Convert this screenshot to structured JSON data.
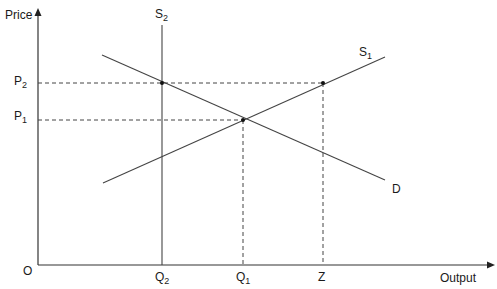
{
  "diagram": {
    "type": "supply-demand",
    "axes": {
      "y_label": "Price",
      "x_label": "Output",
      "origin_label": "O"
    },
    "price_levels": [
      {
        "label": "P",
        "sub": "2",
        "y": 83
      },
      {
        "label": "P",
        "sub": "1",
        "y": 120
      }
    ],
    "quantity_levels": [
      {
        "label": "Q",
        "sub": "2",
        "x": 162
      },
      {
        "label": "Q",
        "sub": "1",
        "x": 243
      },
      {
        "label": "Z",
        "sub": "",
        "x": 323
      }
    ],
    "curves": [
      {
        "name": "S",
        "sub": "2",
        "kind": "vertical supply"
      },
      {
        "name": "S",
        "sub": "1",
        "kind": "upward sloping supply"
      },
      {
        "name": "D",
        "sub": "",
        "kind": "downward sloping demand"
      }
    ],
    "points": [
      {
        "at": "S2 ∩ D",
        "x": 162,
        "y": 83
      },
      {
        "at": "S1 ∩ D",
        "x": 243,
        "y": 120
      },
      {
        "at": "S1 at P2",
        "x": 323,
        "y": 83
      }
    ],
    "colors": {
      "line": "#333333",
      "text": "#1a1a1a"
    }
  }
}
